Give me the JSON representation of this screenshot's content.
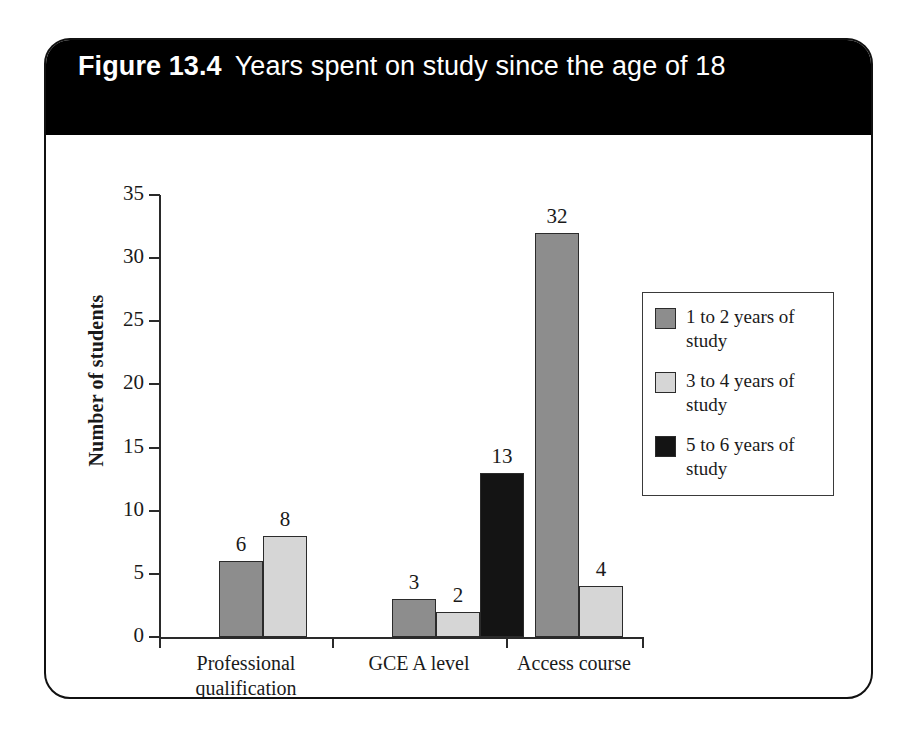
{
  "figure": {
    "number": "Figure 13.4",
    "caption": "Years spent on study since the age of 18"
  },
  "chart_data": {
    "type": "bar",
    "title": "Years spent on study since the age of 18",
    "xlabel": "Study type",
    "ylabel": "Number of students",
    "categories": [
      "Professional qualification",
      "GCE A level",
      "Access course"
    ],
    "category_lines": [
      [
        "Professional",
        "qualification"
      ],
      [
        "GCE A level",
        ""
      ],
      [
        "Access course",
        ""
      ]
    ],
    "series": [
      {
        "name": "1 to 2 years of study",
        "color": "#8d8d8d",
        "values": [
          6,
          3,
          32
        ]
      },
      {
        "name": "3 to 4 years of study",
        "color": "#d6d6d6",
        "values": [
          8,
          2,
          4
        ]
      },
      {
        "name": "5 to 6 years of study",
        "color": "#141414",
        "values": [
          null,
          13,
          null
        ]
      }
    ],
    "ylim": [
      0,
      35
    ],
    "yticks": [
      0,
      5,
      10,
      15,
      20,
      25,
      30,
      35
    ],
    "ytick_labels": [
      "0",
      "5",
      "10",
      "15",
      "20",
      "25",
      "30",
      "35"
    ],
    "grid": false,
    "legend_position": "right",
    "data_labels": [
      {
        "group": 0,
        "series": 0,
        "value": "6"
      },
      {
        "group": 0,
        "series": 1,
        "value": "8"
      },
      {
        "group": 1,
        "series": 0,
        "value": "3"
      },
      {
        "group": 1,
        "series": 1,
        "value": "2"
      },
      {
        "group": 1,
        "series": 2,
        "value": "13"
      },
      {
        "group": 2,
        "series": 0,
        "value": "32"
      },
      {
        "group": 2,
        "series": 1,
        "value": "4"
      }
    ]
  },
  "legend": {
    "entries": [
      {
        "label": "1 to 2 years of study",
        "swatch": "s1"
      },
      {
        "label": "3 to 4 years of study",
        "swatch": "s2"
      },
      {
        "label": "5 to 6 years of study",
        "swatch": "s3"
      }
    ]
  }
}
